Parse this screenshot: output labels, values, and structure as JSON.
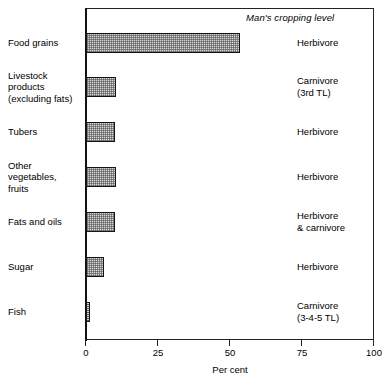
{
  "chart_data": {
    "type": "bar",
    "orientation": "horizontal",
    "title": "",
    "header_note": "Man's cropping level",
    "xlabel": "Per cent",
    "ylabel": "",
    "xlim": [
      0,
      100
    ],
    "xticks": [
      0,
      25,
      50,
      75,
      100
    ],
    "xtick_labels": [
      "0",
      "25",
      "50",
      "75",
      "100"
    ],
    "grid": false,
    "legend": "none",
    "categories": [
      "Food grains",
      "Livestock products (excluding fats)",
      "Tubers",
      "Other vegetables, fruits",
      "Fats and oils",
      "Sugar",
      "Fish"
    ],
    "values": [
      53.5,
      10.5,
      10.0,
      10.3,
      10.0,
      6.2,
      1.4
    ],
    "annotations": [
      "Herbivore",
      "Carnivore (3rd TL)",
      "Herbivore",
      "Herbivore",
      "Herbivore & carnivore",
      "Herbivore",
      "Carnivore (3-4-5 TL)"
    ],
    "bar_fill": "#d8d8d8",
    "bar_edge": "#151515"
  },
  "rows": [
    {
      "label_lines": [
        "Food grains"
      ],
      "value": 53.5,
      "level_lines": [
        "Herbivore"
      ]
    },
    {
      "label_lines": [
        "Livestock",
        "products",
        "(excluding fats)"
      ],
      "value": 10.5,
      "level_lines": [
        "Carnivore",
        "(3rd TL)"
      ]
    },
    {
      "label_lines": [
        "Tubers"
      ],
      "value": 10.0,
      "level_lines": [
        "Herbivore"
      ]
    },
    {
      "label_lines": [
        "Other",
        "vegetables,",
        "fruits"
      ],
      "value": 10.3,
      "level_lines": [
        "Herbivore"
      ]
    },
    {
      "label_lines": [
        "Fats and oils"
      ],
      "value": 10.0,
      "level_lines": [
        "Herbivore",
        "& carnivore"
      ]
    },
    {
      "label_lines": [
        "Sugar"
      ],
      "value": 6.2,
      "level_lines": [
        "Herbivore"
      ]
    },
    {
      "label_lines": [
        "Fish"
      ],
      "value": 1.4,
      "level_lines": [
        "Carnivore",
        "(3-4-5 TL)"
      ]
    }
  ],
  "axis": {
    "header_note": "Man's cropping level",
    "title": "Per cent",
    "ticks": [
      "0",
      "25",
      "50",
      "75",
      "100"
    ]
  }
}
